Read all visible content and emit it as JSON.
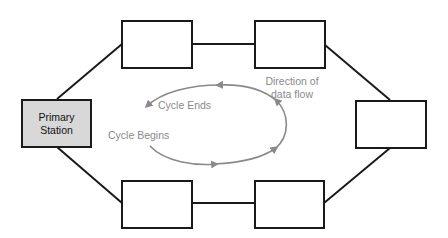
{
  "diagram": {
    "type": "ring-network",
    "nodes": [
      {
        "id": "primary",
        "label_line1": "Primary",
        "label_line2": "Station",
        "fill": "#d8d8d8"
      },
      {
        "id": "top-left",
        "label": ""
      },
      {
        "id": "top-right",
        "label": ""
      },
      {
        "id": "right",
        "label": ""
      },
      {
        "id": "bottom-right",
        "label": ""
      },
      {
        "id": "bottom-left",
        "label": ""
      }
    ],
    "edges": [
      [
        "primary",
        "top-left"
      ],
      [
        "top-left",
        "top-right"
      ],
      [
        "top-right",
        "right"
      ],
      [
        "right",
        "bottom-right"
      ],
      [
        "bottom-right",
        "bottom-left"
      ],
      [
        "bottom-left",
        "primary"
      ]
    ],
    "cycle": {
      "start_label": "Cycle Begins",
      "end_label": "Cycle Ends",
      "direction_label_line1": "Direction of",
      "direction_label_line2": "data flow",
      "direction": "clockwise",
      "color": "#8a8a8a"
    },
    "colors": {
      "border": "#1a1a1a",
      "primary_fill": "#d8d8d8",
      "annotation": "#8a8a8a"
    }
  }
}
